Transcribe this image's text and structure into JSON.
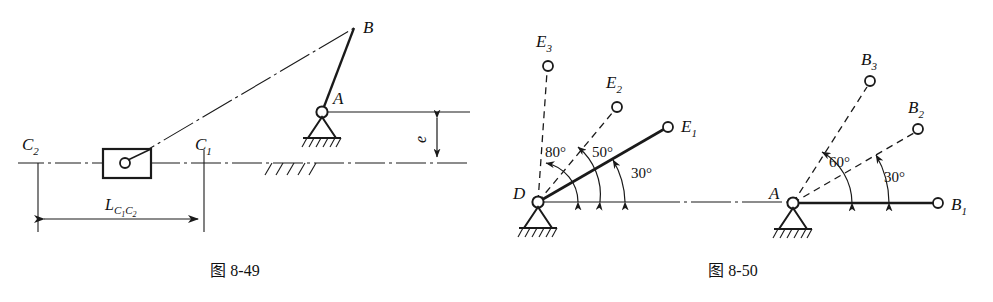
{
  "page": {
    "background": "#ffffff",
    "ink": "#1a1a1a",
    "width": 993,
    "height": 302
  },
  "figures": [
    {
      "id": "fig-8-49",
      "caption": "图 8-49",
      "title_zh": "图 8-49",
      "description": "Offset slider-crank mechanism layout diagram",
      "labels": {
        "pivot_a": "A",
        "crank_end_b": "B",
        "slider_pos_1": "C",
        "slider_pos_1_sub": "1",
        "slider_pos_2": "C",
        "slider_pos_2_sub": "2",
        "offset": "e",
        "stroke_dim": "L",
        "stroke_dim_sub": "C₁C₂"
      },
      "dimensions": {
        "stroke_label_main": "L",
        "stroke_label_sub_1": "C",
        "stroke_label_sub_1_idx": "1",
        "stroke_label_sub_2": "C",
        "stroke_label_sub_2_idx": "2",
        "offset_label": "e"
      }
    },
    {
      "id": "fig-8-50",
      "caption": "图 8-50",
      "title_zh": "图 8-50",
      "description": "Two fixed pivots D and A with three angular link positions each",
      "pivots": [
        {
          "name": "D",
          "label": "D",
          "x": 538,
          "y": 202,
          "links": [
            {
              "label": "E",
              "sub": "1",
              "angle_deg": 30,
              "style": "solid",
              "length": 148
            },
            {
              "label": "E",
              "sub": "2",
              "angle_deg": 50,
              "style": "dashed",
              "length": 148
            },
            {
              "label": "E",
              "sub": "3",
              "angle_deg": 80,
              "style": "dashed",
              "length": 140
            }
          ],
          "angle_labels": [
            {
              "text": "30°",
              "x": 643,
              "y": 173
            },
            {
              "text": "50°",
              "x": 601,
              "y": 153
            },
            {
              "text": "80°",
              "x": 552,
              "y": 153
            }
          ]
        },
        {
          "name": "A",
          "label": "A",
          "x": 793,
          "y": 203,
          "links": [
            {
              "label": "B",
              "sub": "1",
              "angle_deg": 0,
              "style": "solid",
              "length": 145
            },
            {
              "label": "B",
              "sub": "2",
              "angle_deg": 30,
              "style": "dashed",
              "length": 145
            },
            {
              "label": "B",
              "sub": "3",
              "angle_deg": 60,
              "style": "dashed",
              "length": 145
            }
          ],
          "angle_labels": [
            {
              "text": "30°",
              "x": 892,
              "y": 178
            },
            {
              "text": "60°",
              "x": 842,
              "y": 163
            }
          ]
        }
      ]
    }
  ],
  "angle_values": {
    "d_e1": "30°",
    "d_e2": "50°",
    "d_e3": "80°",
    "a_b2": "30°",
    "a_b3": "60°"
  },
  "point_labels": {
    "A_left": "A",
    "B_left": "B",
    "C1": "C",
    "C1_sub": "1",
    "C2": "C",
    "C2_sub": "2",
    "e": "e",
    "L": "L",
    "D": "D",
    "A_right": "A",
    "E1": "E",
    "E1_sub": "1",
    "E2": "E",
    "E2_sub": "2",
    "E3": "E",
    "E3_sub": "3",
    "B1": "B",
    "B1_sub": "1",
    "B2": "B",
    "B2_sub": "2",
    "B3": "B",
    "B3_sub": "3"
  },
  "captions": {
    "left": "图 8-49",
    "right": "图 8-50"
  }
}
